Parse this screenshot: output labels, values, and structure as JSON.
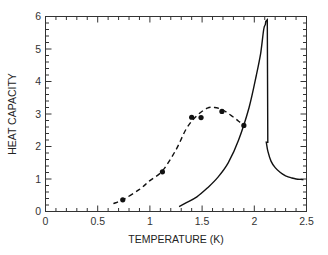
{
  "chart_data": {
    "type": "line",
    "title": "",
    "xlabel": "TEMPERATURE (K)",
    "ylabel": "HEAT CAPACITY",
    "xlim": [
      0,
      2.5
    ],
    "ylim": [
      0,
      6
    ],
    "x_ticks": [
      0,
      0.5,
      1,
      1.5,
      2,
      2.5
    ],
    "x_tick_labels": [
      "0",
      "0.5",
      "1",
      "1.5",
      "2",
      "2.5"
    ],
    "y_ticks": [
      0,
      1,
      2,
      3,
      4,
      5,
      6
    ],
    "y_tick_labels": [
      "0",
      "1",
      "2",
      "3",
      "4",
      "5",
      "6"
    ],
    "x_minor_step": 0.1,
    "y_minor_step": 0.2,
    "grid": false,
    "legend": null,
    "series": [
      {
        "name": "dashed fit (measured trend)",
        "style": "dashed",
        "x": [
          0.65,
          0.75,
          0.9,
          1.0,
          1.12,
          1.25,
          1.35,
          1.45,
          1.55,
          1.62,
          1.7,
          1.78,
          1.85,
          1.9
        ],
        "y": [
          0.24,
          0.38,
          0.68,
          0.95,
          1.25,
          1.9,
          2.55,
          2.95,
          3.18,
          3.2,
          3.12,
          2.95,
          2.78,
          2.65
        ]
      },
      {
        "name": "measured points",
        "style": "markers",
        "x": [
          0.74,
          1.12,
          1.4,
          1.49,
          1.69,
          1.9
        ],
        "y": [
          0.36,
          1.22,
          2.9,
          2.89,
          3.08,
          2.65
        ]
      },
      {
        "name": "solid curve",
        "style": "solid",
        "x": [
          1.28,
          1.35,
          1.45,
          1.55,
          1.65,
          1.75,
          1.85,
          1.95,
          2.02,
          2.06,
          2.09,
          2.105,
          2.11,
          2.115,
          2.13,
          2.16,
          2.2,
          2.25,
          2.3,
          2.35,
          2.4,
          2.47
        ],
        "y": [
          0.15,
          0.27,
          0.45,
          0.72,
          1.05,
          1.5,
          2.2,
          3.2,
          4.2,
          4.85,
          5.6,
          5.75,
          5.85,
          2.13,
          1.85,
          1.55,
          1.35,
          1.2,
          1.1,
          1.04,
          1.0,
          0.98
        ]
      }
    ]
  }
}
